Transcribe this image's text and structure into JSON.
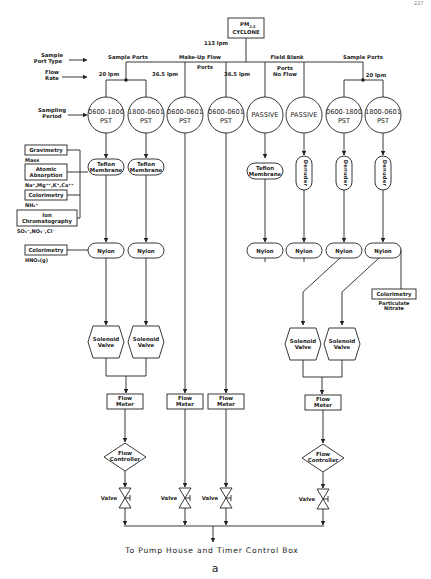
{
  "page_number": "227",
  "header": {
    "row_labels": {
      "sample_port_type": [
        "Sample",
        "Port Type"
      ],
      "flow_rate": [
        "Flow",
        "Rate"
      ],
      "sampling_period": [
        "Sampling",
        "Period"
      ]
    },
    "source": {
      "line1": "PM",
      "subscript": "2.5",
      "line2": "CYCLONE",
      "flow": "113 lpm"
    },
    "port_groups": [
      {
        "label": "Sample Ports",
        "flow": "20 lpm"
      },
      {
        "label": "Make-Up Flow",
        "sub_label": "Ports",
        "flows": [
          "36.5 lpm",
          "36.5 lpm"
        ]
      },
      {
        "label": "Field Blank",
        "sub_label": [
          "Ports",
          "No Flow"
        ]
      },
      {
        "label": "Sample Ports",
        "flow": "20 lpm"
      }
    ]
  },
  "sampling_periods": [
    {
      "line1": "0600-1800",
      "line2": "PST"
    },
    {
      "line1": "1800-0601",
      "line2": "PST"
    },
    {
      "line1": "0600-0601",
      "line2": "PST"
    },
    {
      "line1": "0600-0601",
      "line2": "PST"
    },
    {
      "line1": "PASSIVE",
      "line2": ""
    },
    {
      "line1": "PASSIVE",
      "line2": ""
    },
    {
      "line1": "0600-1800",
      "line2": "PST"
    },
    {
      "line1": "1800-0601",
      "line2": "PST"
    }
  ],
  "filters": {
    "teflon": [
      "Teflon",
      "Membrane"
    ],
    "denuder": "Denuder",
    "nylon": "Nylon"
  },
  "analyses_left": [
    {
      "method": [
        "Gravimetry"
      ],
      "analyte": "Mass"
    },
    {
      "method": [
        "Atomic",
        "Absorption"
      ],
      "analyte": "Na⁺,Mg⁺⁺,K⁺,Ca⁺⁺"
    },
    {
      "method": [
        "Colorimetry"
      ],
      "analyte": "NH₄⁺"
    },
    {
      "method": [
        "Ion",
        "Chromatography"
      ],
      "analyte": "SO₄⁼,NO₃⁻,Cl⁻"
    },
    {
      "method": [
        "Colorimetry"
      ],
      "analyte": "HNO₃(g)"
    }
  ],
  "analyses_right": [
    {
      "method": [
        "Colorimetry"
      ],
      "analyte": [
        "Particulate",
        "Nitrate"
      ]
    }
  ],
  "components": {
    "solenoid_valve": [
      "Solenoid",
      "Valve"
    ],
    "flow_meter": [
      "Flow",
      "Meter"
    ],
    "flow_controller": [
      "Flow",
      "Controller"
    ],
    "valve": "Valve"
  },
  "footer": {
    "destination": "To Pump House and Timer Control Box",
    "caption": "a"
  },
  "colors": {
    "line": "#222222",
    "background": "#ffffff"
  }
}
